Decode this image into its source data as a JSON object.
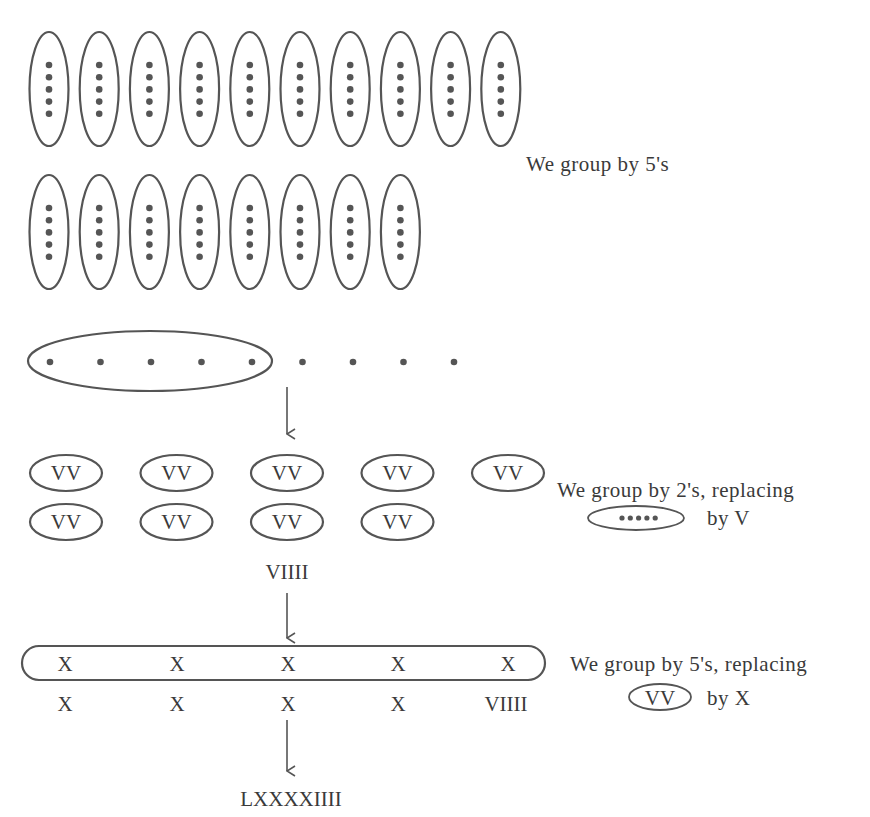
{
  "title_partial": "",
  "steps": {
    "step1": {
      "caption": "We group by 5's",
      "row1_groups": 10,
      "row2_groups": 8,
      "dots_per_group": 5
    },
    "step2": {
      "circled_dots": 5,
      "loose_dots": 4
    },
    "step3": {
      "caption_line1": "We group by 2's, replacing",
      "caption_line2": "by V",
      "legend_dots": 5,
      "group_label": "VV",
      "row1_groups": 5,
      "row2_groups": 4,
      "remainder": "VIIII"
    },
    "step4": {
      "caption_line1": "We group by 5's, replacing",
      "caption_line2": "by X",
      "legend_label": "VV",
      "circled_items": [
        "X",
        "X",
        "X",
        "X",
        "X"
      ],
      "below_items": [
        "X",
        "X",
        "X",
        "X",
        "VIIII"
      ]
    },
    "result": "LXXXXIIII"
  },
  "colors": {
    "ink": "#555555",
    "text": "#3a3a3a",
    "background": "#ffffff"
  }
}
